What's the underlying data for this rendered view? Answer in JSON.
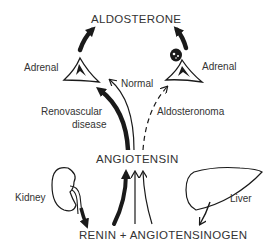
{
  "diagram": {
    "type": "physiology-flow",
    "nodes": {
      "aldosterone": "ALDOSTERONE",
      "angiotensin": "ANGIOTENSIN",
      "renin_angiotensinogen": "RENIN + ANGIOTENSINOGEN"
    },
    "organs": {
      "adrenal_left": "Adrenal",
      "adrenal_right": "Adrenal",
      "kidney": "Kidney",
      "liver": "Liver"
    },
    "pathways": {
      "normal": "Normal",
      "renovascular_line1": "Renovascular",
      "renovascular_line2": "disease",
      "aldosteronoma": "Aldosteronoma"
    },
    "colors": {
      "ink": "#1a1a1a",
      "text": "#333333",
      "background": "#ffffff"
    }
  }
}
